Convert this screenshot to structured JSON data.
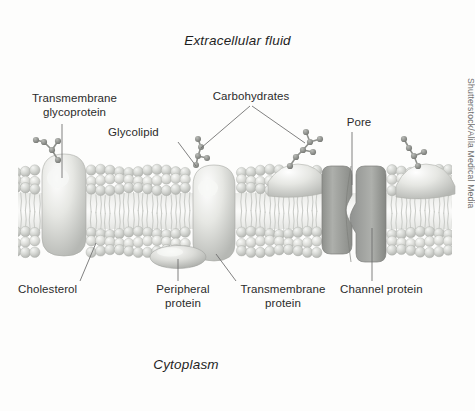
{
  "figure": {
    "credit": "Shutterstock/Alila Medical Media",
    "background_color": "#fdfdfc",
    "region_labels": {
      "top": "Extracellular fluid",
      "bottom": "Cytoplasm"
    },
    "part_labels": [
      {
        "id": "transmembrane-glycoprotein",
        "text": "Transmembrane\nglycoprotein"
      },
      {
        "id": "glycolipid",
        "text": "Glycolipid"
      },
      {
        "id": "carbohydrates",
        "text": "Carbohydrates"
      },
      {
        "id": "pore",
        "text": "Pore"
      },
      {
        "id": "cholesterol",
        "text": "Cholesterol"
      },
      {
        "id": "peripheral-protein",
        "text": "Peripheral\nprotein"
      },
      {
        "id": "transmembrane-protein",
        "text": "Transmembrane\nprotein"
      },
      {
        "id": "channel-protein",
        "text": "Channel protein"
      }
    ],
    "colors": {
      "label_text": "#2b2b2b",
      "region_text": "#1f1f1f",
      "leader_line": "#6a6a6a",
      "lipid_head": "#c2c4c1",
      "lipid_head_light": "#e2e3e0",
      "lipid_tail": "#d8d9d6",
      "protein_fill": "#d9dad6",
      "channel_fill": "#9a9c98",
      "carbohydrate_bead": "#8e908c",
      "credit_text": "#6e6e6e"
    }
  }
}
